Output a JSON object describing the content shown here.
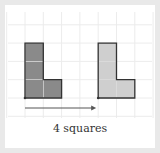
{
  "diagram": {
    "type": "translation",
    "caption": "4 squares",
    "shift_squares": 4,
    "shape_cells": [
      [
        0,
        0
      ],
      [
        0,
        1
      ],
      [
        0,
        2
      ],
      [
        1,
        0
      ]
    ],
    "colors": {
      "original_fill": "#8a8a8a",
      "image_fill": "#cfcfcf",
      "outline": "#333333",
      "grid": "#ececec",
      "arrow": "#555555"
    }
  }
}
